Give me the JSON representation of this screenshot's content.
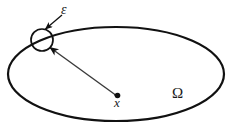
{
  "figure": {
    "background_color": "#ffffff",
    "stroke_color": "#111111",
    "labels": {
      "epsilon": "ε",
      "omega": "Ω",
      "point_vector": "x"
    },
    "icons": {
      "epsilon_pointer": "arrow-icon",
      "position_vector": "vector-arrow-icon",
      "center_point": "dot-icon"
    },
    "geometry": {
      "domain_ellipse": {
        "center_x": 116,
        "center_y": 74,
        "radius_x": 108,
        "radius_y": 47,
        "stroke_width": 2.2
      },
      "epsilon_circle": {
        "center_x": 42,
        "center_y": 40,
        "radius": 11,
        "stroke_width": 1.6
      },
      "center_dot": {
        "x": 118,
        "y": 96,
        "radius": 2.6
      },
      "position_vector_line": {
        "x1": 117,
        "y1": 96,
        "x2": 48,
        "y2": 46,
        "stroke_width": 1.3
      },
      "epsilon_pointer_line": {
        "x1": 62,
        "y1": 16,
        "x2": 45,
        "y2": 30,
        "stroke_width": 1.2
      }
    }
  }
}
